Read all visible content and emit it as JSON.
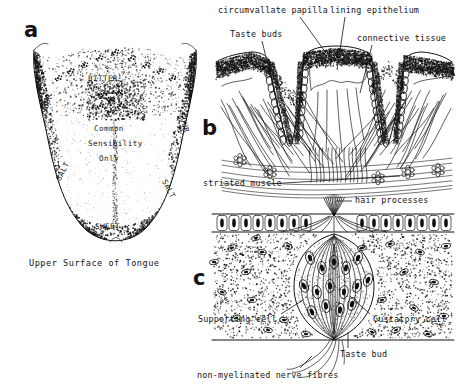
{
  "figure": {
    "panels": [
      {
        "letter": "a",
        "title": "Upper Surface of Tongue"
      },
      {
        "letter": "b",
        "title": "circumvallate papilla section"
      },
      {
        "letter": "c",
        "title": "taste bud"
      }
    ]
  },
  "panel_a": {
    "letter": "a",
    "caption": "Upper Surface of Tongue",
    "taste_zones": {
      "bitter": "BITTER",
      "sour_left": "SOUR",
      "sour_right": "SOUR",
      "salt_left": "SALT",
      "salt_right": "SALT",
      "sweet": "SWEET"
    },
    "center_text_line1": "Common",
    "center_text_line2": "Sensibility",
    "center_text_line3": "Only"
  },
  "panel_b": {
    "letter": "b",
    "labels": {
      "circumvallate_papilla": "circumvallate papilla",
      "lining_epithelium": "lining epithelium",
      "taste_buds": "Taste buds",
      "connective_tissue": "connective tissue",
      "striated_muscle": "striated muscle"
    }
  },
  "panel_c": {
    "letter": "c",
    "labels": {
      "hair_processes": "hair processes",
      "supporting_cell": "Supporting cell",
      "gustatory_cell": "Gustatory cell",
      "taste_bud": "Taste bud",
      "nerve_fibres": "non-myelinated nerve fibres"
    }
  },
  "colors": {
    "ink": "#101010",
    "background": "#ffffff"
  }
}
